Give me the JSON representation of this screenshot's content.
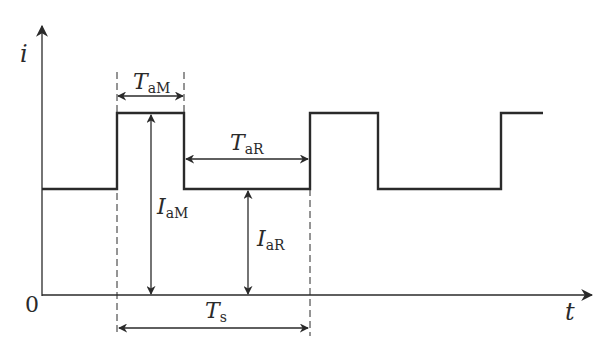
{
  "diagram": {
    "type": "pulse-waveform",
    "axes": {
      "y_label": "i",
      "x_label": "t",
      "origin_label": "0"
    },
    "annotations": {
      "TaM": {
        "main": "T",
        "sub": "aM"
      },
      "TaR": {
        "main": "T",
        "sub": "aR"
      },
      "IaM": {
        "main": "I",
        "sub": "aM"
      },
      "IaR": {
        "main": "I",
        "sub": "aR"
      },
      "Ts": {
        "main": "T",
        "sub": "s"
      }
    },
    "waveform": {
      "description": "Rectangular pulsed current alternating between peak (IaM) and base (IaR) levels with period Ts",
      "high_duration": "TaM",
      "low_duration": "TaR",
      "period": "Ts"
    },
    "colors": {
      "line": "#2a2a2a",
      "background": "#ffffff"
    }
  }
}
